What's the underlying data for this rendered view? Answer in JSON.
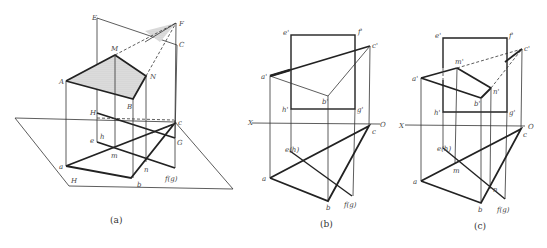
{
  "figures": [
    {
      "caption": "(a)",
      "labels": {
        "E": "E",
        "F": "F",
        "M": "M",
        "N": "N",
        "A": "A",
        "B": "B",
        "C": "C",
        "H": "H",
        "G": "G",
        "e": "e",
        "h": "h",
        "m": "m",
        "n": "n",
        "a": "a",
        "b": "b",
        "c": "c",
        "fg": "f(g)",
        "plane": "H"
      }
    },
    {
      "caption": "(b)",
      "labels": {
        "e1": "e'",
        "f1": "f'",
        "c1": "c'",
        "a1": "a'",
        "b1": "b'",
        "h1": "h'",
        "g1": "g'",
        "X": "X",
        "O": "O",
        "c": "c",
        "eh": "e(h)",
        "a": "a",
        "b": "b",
        "fg": "f(g)"
      }
    },
    {
      "caption": "(c)",
      "labels": {
        "e1": "e'",
        "f1": "f'",
        "c1": "c'",
        "m1": "m'",
        "a1": "a'",
        "n1": "n'",
        "b1": "b'",
        "h1": "h'",
        "g1": "g'",
        "X": "X",
        "O": "O",
        "c": "c",
        "eh": "e(h)",
        "m": "m",
        "a": "a",
        "n": "n",
        "b": "b",
        "fg": "f(g)"
      }
    }
  ]
}
